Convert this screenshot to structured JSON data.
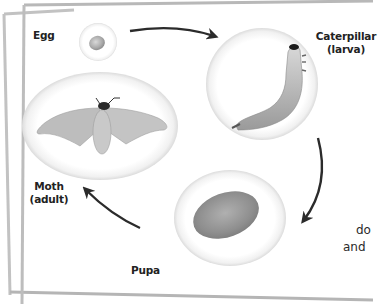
{
  "diagram": {
    "type": "life-cycle",
    "stages": [
      {
        "id": "egg",
        "label": "Egg",
        "sublabel": ""
      },
      {
        "id": "caterpillar",
        "label": "Caterpillar",
        "sublabel": "(larva)"
      },
      {
        "id": "pupa",
        "label": "Pupa",
        "sublabel": ""
      },
      {
        "id": "moth",
        "label": "Moth",
        "sublabel": "(adult)"
      }
    ],
    "arrows": [
      {
        "from": "egg",
        "to": "caterpillar"
      },
      {
        "from": "caterpillar",
        "to": "pupa"
      },
      {
        "from": "pupa",
        "to": "moth"
      }
    ],
    "side_text": {
      "line1": "do",
      "line2": "and"
    }
  },
  "colors": {
    "background": "#ffffff",
    "frame_border": "#b8b8b8",
    "arrow": "#2b2b2b",
    "label_text": "#222222"
  }
}
